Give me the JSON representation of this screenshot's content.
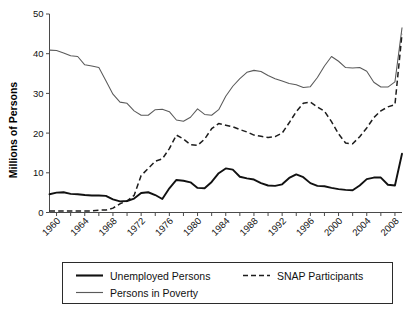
{
  "chart_data": {
    "type": "line",
    "title": "",
    "xlabel": "",
    "ylabel": "Millions of Persons",
    "xlim": [
      1959,
      2009
    ],
    "ylim": [
      0,
      50
    ],
    "ytick_labels": [
      "0",
      "10",
      "20",
      "30",
      "40",
      "50"
    ],
    "ytick_values": [
      0,
      10,
      20,
      30,
      40,
      50
    ],
    "xtick_labels": [
      "1960",
      "1964",
      "1968",
      "1972",
      "1976",
      "1980",
      "1984",
      "1988",
      "1992",
      "1996",
      "2000",
      "2004",
      "2008"
    ],
    "xtick_values": [
      1960,
      1964,
      1968,
      1972,
      1976,
      1980,
      1984,
      1988,
      1992,
      1996,
      2000,
      2004,
      2008
    ],
    "x_minor_step": 2,
    "grid": false,
    "legend_position": "bottom",
    "x": [
      1959,
      1960,
      1961,
      1962,
      1963,
      1964,
      1965,
      1966,
      1967,
      1968,
      1969,
      1970,
      1971,
      1972,
      1973,
      1974,
      1975,
      1976,
      1977,
      1978,
      1979,
      1980,
      1981,
      1982,
      1983,
      1984,
      1985,
      1986,
      1987,
      1988,
      1989,
      1990,
      1991,
      1992,
      1993,
      1994,
      1995,
      1996,
      1997,
      1998,
      1999,
      2000,
      2001,
      2002,
      2003,
      2004,
      2005,
      2006,
      2007,
      2008,
      2009
    ],
    "series": [
      {
        "name": "Unemployed Persons",
        "style": "solid-thick",
        "values": [
          4.6,
          5.0,
          5.1,
          4.7,
          4.6,
          4.4,
          4.3,
          4.3,
          4.2,
          3.3,
          2.8,
          2.9,
          3.5,
          4.9,
          5.1,
          4.4,
          3.4,
          6.1,
          8.2,
          8.0,
          7.6,
          6.2,
          6.1,
          7.7,
          9.9,
          11.1,
          10.8,
          9.0,
          8.6,
          8.3,
          7.4,
          6.8,
          6.7,
          7.1,
          8.7,
          9.6,
          8.9,
          7.4,
          6.7,
          6.6,
          6.2,
          5.9,
          5.7,
          5.6,
          6.8,
          8.4,
          8.8,
          8.8,
          7.0,
          6.8,
          14.8
        ]
      },
      {
        "name": "SNAP Participants",
        "style": "dashed",
        "values": [
          0.4,
          0.4,
          0.4,
          0.4,
          0.4,
          0.4,
          0.4,
          0.6,
          0.6,
          1.1,
          2.2,
          2.9,
          4.3,
          9.3,
          11.1,
          12.9,
          13.5,
          16.1,
          19.5,
          18.5,
          17.1,
          16.9,
          18.5,
          21.1,
          22.4,
          22.0,
          21.6,
          20.9,
          20.3,
          19.5,
          19.2,
          18.9,
          19.1,
          20.0,
          22.6,
          25.4,
          27.5,
          27.8,
          26.6,
          25.5,
          22.9,
          19.8,
          17.5,
          17.3,
          19.1,
          21.3,
          23.9,
          25.6,
          26.6,
          27.2,
          45.0
        ]
      },
      {
        "name": "Persons in Poverty",
        "style": "solid-thin",
        "values": [
          40.9,
          40.8,
          40.2,
          39.5,
          39.3,
          37.2,
          36.9,
          36.5,
          33.2,
          29.8,
          27.8,
          27.5,
          25.6,
          24.5,
          24.5,
          25.9,
          26.0,
          25.4,
          23.3,
          23.0,
          24.0,
          26.1,
          24.7,
          24.5,
          25.9,
          29.3,
          31.8,
          33.7,
          35.3,
          35.8,
          35.5,
          34.5,
          33.7,
          33.1,
          32.5,
          32.2,
          31.5,
          31.7,
          34.0,
          36.9,
          39.3,
          38.1,
          36.5,
          36.4,
          36.5,
          35.6,
          32.8,
          31.6,
          31.6,
          32.9,
          46.5
        ]
      }
    ]
  },
  "legend": {
    "entries": [
      {
        "label": "Unemployed Persons",
        "style": "solid-thick"
      },
      {
        "label": "SNAP Participants",
        "style": "dashed"
      },
      {
        "label": "Persons in Poverty",
        "style": "solid-thin"
      }
    ]
  },
  "colors": {
    "unemployed": "#111111",
    "snap": "#1d1d1d",
    "poverty": "#5a5a5a",
    "axis": "#4a4a4a",
    "background": "#ffffff"
  }
}
